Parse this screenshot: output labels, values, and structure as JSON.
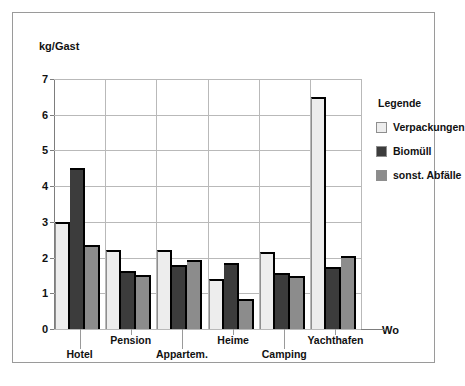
{
  "chart_data": {
    "type": "bar",
    "title": "",
    "subtitle": "",
    "xlabel": "Wo",
    "ylabel": "kg/Gast",
    "ylim": [
      0,
      7
    ],
    "ytick_values": [
      0,
      1,
      2,
      3,
      4,
      5,
      6,
      7
    ],
    "ytick_labels": [
      "0",
      "1",
      "2",
      "3",
      "4",
      "5",
      "6",
      "7"
    ],
    "grid": "horizontal-and-vertical",
    "legend_position": "right",
    "legend_title": "Legende",
    "categories": [
      "Hotel",
      "Pension",
      "Appartem.",
      "Heime",
      "Camping",
      "Yachthafen"
    ],
    "series": [
      {
        "name": "Verpackungen",
        "color": "#ededed",
        "values": [
          3.0,
          2.2,
          2.2,
          1.4,
          2.15,
          6.5
        ]
      },
      {
        "name": "Biomüll",
        "color": "#3c3c3c",
        "values": [
          4.5,
          1.62,
          1.78,
          1.85,
          1.58,
          1.75
        ]
      },
      {
        "name": "sonst. Abfälle",
        "color": "#8c8c8c",
        "values": [
          2.35,
          1.5,
          1.92,
          0.85,
          1.48,
          2.05
        ]
      }
    ]
  },
  "axes": {
    "y_title": "kg/Gast",
    "x_title": "Wo"
  },
  "legend": {
    "title": "Legende",
    "entries": [
      {
        "label": "Verpackungen",
        "color": "#ededed"
      },
      {
        "label": "Biomüll",
        "color": "#3c3c3c"
      },
      {
        "label": "sonst. Abfälle",
        "color": "#8c8c8c"
      }
    ]
  }
}
